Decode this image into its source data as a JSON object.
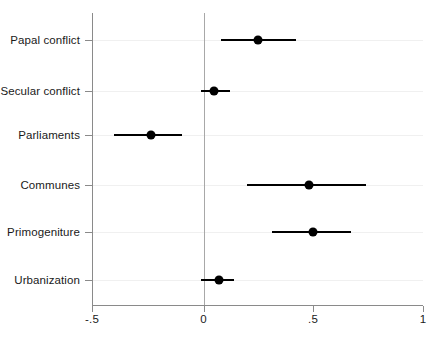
{
  "chart_data": {
    "type": "scatter",
    "subtype": "coefficient-plot-with-confidence-intervals",
    "title": "",
    "subtitle": "",
    "xlabel": "",
    "ylabel": "",
    "xlim": [
      -0.5,
      1
    ],
    "ylim": [
      0,
      6
    ],
    "grid": true,
    "grid_axis": "y",
    "legend": "none",
    "reference_line": {
      "x": 0,
      "style": "solid",
      "color": "#a8a8a8"
    },
    "xticks": [
      {
        "value": -0.5,
        "label": "-.5"
      },
      {
        "value": 0,
        "label": "0"
      },
      {
        "value": 0.5,
        "label": ".5"
      },
      {
        "value": 1,
        "label": "1"
      }
    ],
    "categories": [
      "Papal conflict",
      "Secular conflict",
      "Parliaments",
      "Communes",
      "Primogeniture",
      "Urbanization"
    ],
    "values": [
      0.25,
      0.05,
      -0.24,
      0.48,
      0.5,
      0.07
    ],
    "ci_low": [
      0.08,
      -0.01,
      -0.41,
      0.2,
      0.31,
      -0.01
    ],
    "ci_high": [
      0.42,
      0.12,
      -0.1,
      0.74,
      0.67,
      0.14
    ],
    "points": [
      {
        "category": "Papal conflict",
        "estimate": 0.25,
        "ci_low": 0.08,
        "ci_high": 0.42
      },
      {
        "category": "Secular conflict",
        "estimate": 0.05,
        "ci_low": -0.01,
        "ci_high": 0.12
      },
      {
        "category": "Parliaments",
        "estimate": -0.24,
        "ci_low": -0.41,
        "ci_high": -0.1
      },
      {
        "category": "Communes",
        "estimate": 0.48,
        "ci_low": 0.2,
        "ci_high": 0.74
      },
      {
        "category": "Primogeniture",
        "estimate": 0.5,
        "ci_low": 0.31,
        "ci_high": 0.67
      },
      {
        "category": "Urbanization",
        "estimate": 0.07,
        "ci_low": -0.01,
        "ci_high": 0.14
      }
    ],
    "colors": {
      "marker": "#000000",
      "interval": "#000000",
      "axis": "#8a8a8a",
      "reference": "#a8a8a8",
      "grid": "#f0f0f0",
      "background": "#ffffff",
      "text": "#1a1a1a"
    }
  }
}
